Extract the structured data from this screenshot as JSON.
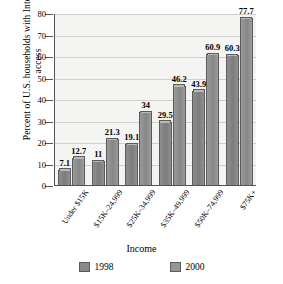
{
  "chart_data": {
    "type": "bar",
    "title": "",
    "xlabel": "Income",
    "ylabel": "Percent of U.S. households with Internet access",
    "ylim": [
      0,
      80
    ],
    "yticks": [
      0,
      10,
      20,
      30,
      40,
      50,
      60,
      70,
      80
    ],
    "grid": true,
    "legend_position": "bottom",
    "categories": [
      "Under $15K",
      "$15K–24,999",
      "$25K–34,999",
      "$35K–49,999",
      "$50K–74,999",
      "$75K+"
    ],
    "series": [
      {
        "name": "1998",
        "color": "#8a8a8a",
        "values": [
          7.1,
          11,
          19.1,
          29.5,
          43.9,
          60.3
        ]
      },
      {
        "name": "2000",
        "color": "#969696",
        "values": [
          12.7,
          21.3,
          34,
          46.2,
          60.9,
          77.7
        ]
      }
    ],
    "value_labels": [
      [
        "7.1",
        "12.7"
      ],
      [
        "11",
        "21.3"
      ],
      [
        "19.1",
        "34"
      ],
      [
        "29.5",
        "46.2"
      ],
      [
        "43.9",
        "60.9"
      ],
      [
        "60.3",
        "77.7"
      ]
    ]
  }
}
